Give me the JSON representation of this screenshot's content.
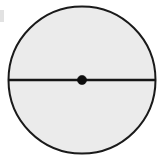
{
  "figure": {
    "title": "Circle with marked center and horizontal diameter",
    "background_color": "#ffffff",
    "width": 161,
    "height": 162
  },
  "chart_data": {
    "type": "diagram",
    "title": "Circle with marked center and horizontal diameter",
    "subtitle": "",
    "xlabel": "",
    "ylabel": "",
    "grid": false,
    "legend": false,
    "legend_position": "none",
    "axis_visible": false,
    "canvas": {
      "width": 161,
      "height": 162,
      "background_color": "#ffffff"
    },
    "shapes": [
      {
        "name": "circle",
        "type": "circle",
        "center_x": 82,
        "center_y": 80,
        "radius": 73.5,
        "fill_color": "#ebebeb",
        "stroke_color": "#1a1a1a",
        "stroke_width": 2,
        "label": ""
      },
      {
        "name": "diameter-line",
        "type": "line",
        "x1": 8.5,
        "y1": 80,
        "x2": 155.5,
        "y2": 80,
        "stroke_color": "#161616",
        "stroke_width": 2.4,
        "label": ""
      },
      {
        "name": "center-point",
        "type": "dot",
        "center_x": 82,
        "center_y": 80,
        "radius": 4.6,
        "fill_color": "#0d0d0d",
        "stroke_color": "#0d0d0d",
        "label": ""
      },
      {
        "name": "scan-artifact-mark",
        "type": "smudge",
        "x": 0,
        "y": 10,
        "width": 4,
        "height": 12,
        "fill_color": "#d8d8d8",
        "label": ""
      }
    ],
    "annotations": [],
    "tick_labels": {
      "x": [],
      "y": []
    },
    "series": []
  }
}
